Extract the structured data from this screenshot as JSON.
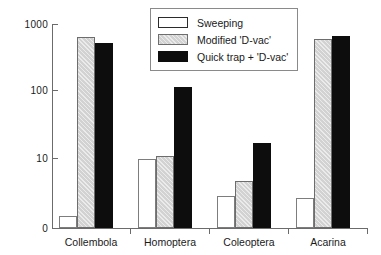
{
  "chart_data": {
    "type": "bar",
    "title": "",
    "subtitle": "",
    "xlabel": "",
    "ylabel": "Log nos./m",
    "ylabel_exponent": "2",
    "yscale": "log",
    "ylim": [
      1,
      1000
    ],
    "ytick_labels": [
      "1000",
      "100",
      "10",
      "0"
    ],
    "ytick_values": [
      1000,
      100,
      10,
      0
    ],
    "grid": false,
    "legend_position": "top-center",
    "categories": [
      "Collembola",
      "Homoptera",
      "Coleoptera",
      "Acarina"
    ],
    "series": [
      {
        "name": "Sweeping",
        "color": "#ffffff",
        "values": [
          1.5,
          10.5,
          3.0,
          2.8
        ]
      },
      {
        "name": "Modified 'D-vac'",
        "color": "#d2d2d2",
        "values": [
          650,
          11.5,
          5.0,
          600
        ]
      },
      {
        "name": "Quick trap + 'D-vac'",
        "color": "#0d0d0d",
        "values": [
          530,
          120,
          18,
          660
        ]
      }
    ],
    "annotations": []
  },
  "legend": {
    "items": [
      {
        "label": "Sweeping",
        "swatch": "white-swatch"
      },
      {
        "label": "Modified 'D-vac'",
        "swatch": "gray-swatch"
      },
      {
        "label": "Quick trap + 'D-vac'",
        "swatch": "black-swatch"
      }
    ]
  }
}
